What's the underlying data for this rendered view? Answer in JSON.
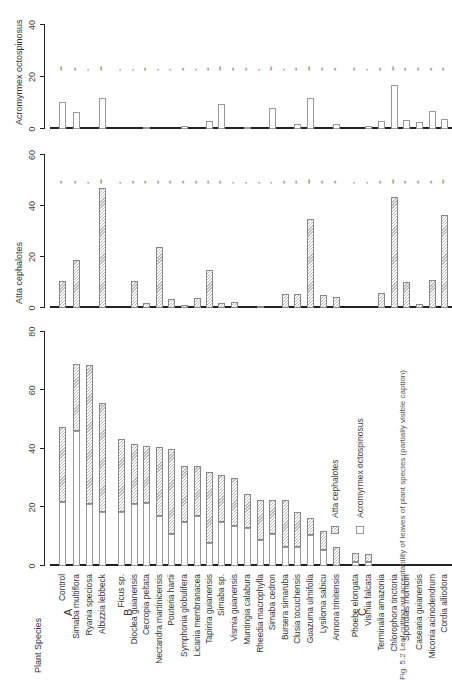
{
  "header": {
    "plant_species_label": "Plant  Species"
  },
  "groups": [
    {
      "label": "A",
      "key": "A"
    },
    {
      "label": "B",
      "key": "B"
    },
    {
      "label": "C",
      "key": "C"
    }
  ],
  "legend": {
    "atta": "Atta cephalotes",
    "acro": "Acromyrmex octospinosus"
  },
  "caption": {
    "text": "Fig. 5.2  Leaf-cutting ant acceptability of leaves of plant species (partially visible caption)"
  },
  "chart_data": [
    {
      "type": "bar",
      "title": "Acromyrmex octospinosus",
      "ylabel": "Acromyrmex octospinosus",
      "ylim": [
        0,
        40
      ],
      "yticks": [
        0,
        20,
        40
      ],
      "categories": [
        "Control",
        "Simaba multiflora",
        "Ryania speciosa",
        "Albizzia lebbeck",
        "Ficus sp.",
        "Dioclea guianensis",
        "Cecropia peltata",
        "Nectandra martinicensis",
        "Pouteria hartii",
        "Symphonia globulifera",
        "Licania membranacea",
        "Tapirira guianensis",
        "Simaba sp.",
        "Vismia guianensis",
        "Muntingia calabura",
        "Rheedia macrophylla",
        "Simaba cedron",
        "Bursera simaruba",
        "Clusia tocuchensis",
        "Guazuma ulmifolia",
        "Lysiloma sabicu",
        "Annona trinitensis",
        "Phoebe elongata",
        "Vismia falcata",
        "Terminalia amazonia",
        "Chlorophora tinctoria",
        "Spondias mombin",
        "Casearia guianensis",
        "Miconia acinodendrum",
        "Cordia alliodora"
      ],
      "values": [
        10.5,
        6.5,
        0,
        12,
        0,
        0,
        0.5,
        0,
        0,
        1,
        0,
        3,
        9.5,
        0,
        0.5,
        0,
        8,
        0,
        2,
        12,
        0,
        2,
        0,
        1,
        3,
        17,
        3.5,
        2.5,
        7,
        4
      ],
      "significance": [
        "***",
        "**",
        "*",
        "***",
        "*",
        "*",
        "**",
        "*",
        "*",
        "**",
        "*",
        "**",
        "***",
        "**",
        "**",
        "*",
        "***",
        "*",
        "**",
        "***",
        "**",
        "**",
        "**",
        "*",
        "**",
        "***",
        "**",
        "**",
        "**",
        "**"
      ]
    },
    {
      "type": "bar",
      "title": "Atta cephalotes",
      "ylabel": "Atta cephalotes",
      "ylim": [
        0,
        60
      ],
      "yticks": [
        0,
        20,
        40,
        60
      ],
      "categories": [
        "Control",
        "Simaba multiflora",
        "Ryania speciosa",
        "Albizzia lebbeck",
        "Ficus sp.",
        "Dioclea guianensis",
        "Cecropia peltata",
        "Nectandra martinicensis",
        "Pouteria hartii",
        "Symphonia globulifera",
        "Licania membranacea",
        "Tapirira guianensis",
        "Simaba sp.",
        "Vismia guianensis",
        "Muntingia calabura",
        "Rheedia macrophylla",
        "Simaba cedron",
        "Bursera simaruba",
        "Clusia tocuchensis",
        "Guazuma ulmifolia",
        "Lysiloma sabicu",
        "Annona trinitensis",
        "Phoebe elongata",
        "Vismia falcata",
        "Terminalia amazonia",
        "Chlorophora tinctoria",
        "Spondias mombin",
        "Casearia guianensis",
        "Miconia acinodendrum",
        "Cordia alliodora"
      ],
      "values": [
        10.5,
        19,
        0,
        47,
        0,
        10.5,
        2,
        24,
        3.5,
        1,
        4,
        15,
        2,
        2.5,
        0,
        0.5,
        0,
        5.5,
        5.5,
        35,
        5,
        4.5,
        0,
        0,
        6,
        43.5,
        10,
        1.5,
        11,
        36.5
      ],
      "significance": [
        "**",
        "**",
        "*",
        "***",
        "*",
        "**",
        "**",
        "**",
        "**",
        "**",
        "**",
        "**",
        "**",
        "*",
        "*",
        "*",
        "*",
        "**",
        "**",
        "***",
        "**",
        "**",
        "*",
        "*",
        "**",
        "***",
        "**",
        "**",
        "**",
        "***"
      ]
    },
    {
      "type": "bar",
      "stacked": true,
      "title": "Combined acceptability",
      "ylabel": "",
      "xlabel": "Plant Species",
      "ylim": [
        0,
        80
      ],
      "yticks": [
        0,
        20,
        40,
        60,
        80
      ],
      "legend": [
        "Atta cephalotes",
        "Acromyrmex octospinosus"
      ],
      "groups": {
        "A": [
          0,
          1,
          2,
          3
        ],
        "B": [
          4,
          5,
          6,
          7,
          8,
          9,
          10,
          11,
          12,
          13,
          14,
          15,
          16,
          17,
          18,
          19,
          20,
          21
        ],
        "C": [
          22,
          23,
          24,
          25,
          26,
          27,
          28,
          29
        ]
      },
      "categories": [
        "Control",
        "Simaba multiflora",
        "Ryania speciosa",
        "Albizzia lebbeck",
        "Ficus sp.",
        "Dioclea guianensis",
        "Cecropia peltata",
        "Nectandra martinicensis",
        "Pouteria hartii",
        "Symphonia globulifera",
        "Licania membranacea",
        "Tapirira guianensis",
        "Simaba sp.",
        "Vismia guianensis",
        "Muntingia calabura",
        "Rheedia macrophylla",
        "Simaba cedron",
        "Bursera simaruba",
        "Clusia tocuchensis",
        "Guazuma ulmifolia",
        "Lysiloma sabicu",
        "Annona trinitensis",
        "Phoebe elongata",
        "Vismia falcata",
        "Terminalia amazonia",
        "Chlorophora tinctoria",
        "Spondias mombin",
        "Casearia guianensis",
        "Miconia acinodendrum",
        "Cordia alliodora"
      ],
      "series": [
        {
          "name": "Acromyrmex octospinosus",
          "values": [
            22,
            46,
            21,
            18.5,
            18.5,
            21,
            21.5,
            17,
            11,
            15,
            17,
            8,
            15,
            13.5,
            13,
            9,
            11,
            6.5,
            6.5,
            10.5,
            5.5,
            0,
            1.5,
            1.5,
            0,
            0,
            0,
            0,
            0,
            0
          ]
        },
        {
          "name": "Atta cephalotes",
          "values": [
            25.5,
            23,
            47.5,
            37,
            25,
            20.5,
            19.5,
            23.5,
            29,
            19,
            17,
            24,
            16,
            16.5,
            11.5,
            13.5,
            11.5,
            16,
            12,
            6,
            6.5,
            6.5,
            3,
            2.5,
            0,
            0,
            0,
            0,
            0,
            0
          ]
        }
      ],
      "totals": [
        47.5,
        69,
        68.5,
        55.5,
        43.5,
        41.5,
        41,
        40.5,
        40,
        34,
        34,
        32,
        31,
        30,
        24.5,
        22.5,
        22.5,
        22.5,
        18.5,
        16.5,
        12,
        6.5,
        4.5,
        4,
        0,
        0,
        0,
        0,
        0,
        0
      ]
    }
  ]
}
